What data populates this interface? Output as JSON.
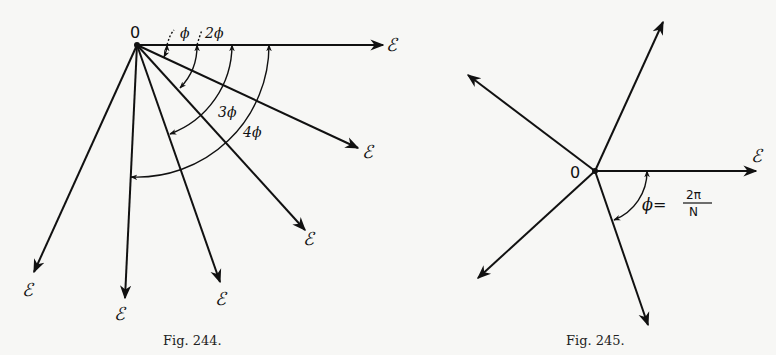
{
  "figures": [
    {
      "id": "fig244",
      "caption": "Fig. 244.",
      "origin_label": "0",
      "origin": [
        137,
        45
      ],
      "vectors": [
        {
          "tip": [
            383,
            45
          ],
          "label": "ℰ",
          "label_pos": [
            386,
            51
          ]
        },
        {
          "tip": [
            358,
            148
          ],
          "label": "ℰ",
          "label_pos": [
            362,
            158
          ]
        },
        {
          "tip": [
            305,
            230
          ],
          "label": "ℰ",
          "label_pos": [
            303,
            245
          ]
        },
        {
          "tip": [
            220,
            282
          ],
          "label": "ℰ",
          "label_pos": [
            215,
            305
          ]
        },
        {
          "tip": [
            125,
            298
          ],
          "label": "ℰ",
          "label_pos": [
            114,
            320
          ]
        },
        {
          "tip": [
            34,
            272
          ],
          "label": "ℰ",
          "label_pos": [
            22,
            296
          ]
        }
      ],
      "angle_labels": [
        {
          "text": "ϕ",
          "pos": [
            180,
            38
          ]
        },
        {
          "text": "2ϕ",
          "pos": [
            205,
            38
          ]
        },
        {
          "text": "3ϕ",
          "pos": [
            218,
            117
          ]
        },
        {
          "text": "4ϕ",
          "pos": [
            243,
            137
          ]
        }
      ]
    },
    {
      "id": "fig245",
      "caption": "Fig. 245.",
      "origin_label": "0",
      "origin": [
        595,
        171
      ],
      "vectors": [
        {
          "tip": [
            756,
            171
          ],
          "label": "ℰ",
          "label_pos": [
            751,
            162
          ]
        },
        {
          "tip": [
            663,
            22
          ],
          "label": ""
        },
        {
          "tip": [
            468,
            75
          ],
          "label": ""
        },
        {
          "tip": [
            478,
            278
          ],
          "label": ""
        },
        {
          "tip": [
            648,
            325
          ],
          "label": ""
        }
      ],
      "angle_equation": {
        "lhs": "ϕ=",
        "numerator": "2π",
        "denominator": "N"
      }
    }
  ]
}
